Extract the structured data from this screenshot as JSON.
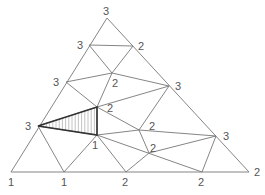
{
  "diagram": {
    "type": "triangulated simplex with vertex labels (Sperner labeling)",
    "nodes": [
      {
        "id": "n0",
        "x": 107,
        "y": 18,
        "label": "3",
        "lx": 103,
        "ly": 15
      },
      {
        "id": "n1",
        "x": 89,
        "y": 45,
        "label": "3",
        "lx": 77,
        "ly": 49
      },
      {
        "id": "n2",
        "x": 133,
        "y": 46,
        "label": "2",
        "lx": 138,
        "ly": 50
      },
      {
        "id": "n3",
        "x": 112,
        "y": 73,
        "label": "2",
        "lx": 112,
        "ly": 87
      },
      {
        "id": "n4",
        "x": 66,
        "y": 82,
        "label": "3",
        "lx": 53,
        "ly": 86
      },
      {
        "id": "n5",
        "x": 169,
        "y": 86,
        "label": "3",
        "lx": 175,
        "ly": 90
      },
      {
        "id": "n6",
        "x": 97,
        "y": 107,
        "label": "2",
        "lx": 107,
        "ly": 112
      },
      {
        "id": "n7",
        "x": 38,
        "y": 126,
        "label": "3",
        "lx": 25,
        "ly": 130
      },
      {
        "id": "n8",
        "x": 97,
        "y": 135,
        "label": "1",
        "lx": 92,
        "ly": 149
      },
      {
        "id": "n9",
        "x": 139,
        "y": 130,
        "label": "2",
        "lx": 149,
        "ly": 130
      },
      {
        "id": "n10",
        "x": 149,
        "y": 153,
        "label": "2",
        "lx": 150,
        "ly": 152
      },
      {
        "id": "n11",
        "x": 216,
        "y": 136,
        "label": "3",
        "lx": 223,
        "ly": 140
      },
      {
        "id": "n12",
        "x": 11,
        "y": 172,
        "label": "1",
        "lx": 8,
        "ly": 186
      },
      {
        "id": "n13",
        "x": 64,
        "y": 172,
        "label": "1",
        "lx": 61,
        "ly": 186
      },
      {
        "id": "n14",
        "x": 126,
        "y": 172,
        "label": "2",
        "lx": 122,
        "ly": 186
      },
      {
        "id": "n15",
        "x": 202,
        "y": 172,
        "label": "2",
        "lx": 198,
        "ly": 186
      },
      {
        "id": "n16",
        "x": 249,
        "y": 172,
        "label": "2",
        "lx": 254,
        "ly": 176
      }
    ],
    "edges": [
      [
        "n0",
        "n12"
      ],
      [
        "n0",
        "n16"
      ],
      [
        "n12",
        "n16"
      ],
      [
        "n1",
        "n2"
      ],
      [
        "n1",
        "n3"
      ],
      [
        "n2",
        "n3"
      ],
      [
        "n4",
        "n3"
      ],
      [
        "n3",
        "n5"
      ],
      [
        "n4",
        "n6"
      ],
      [
        "n3",
        "n6"
      ],
      [
        "n6",
        "n5"
      ],
      [
        "n6",
        "n9"
      ],
      [
        "n5",
        "n9"
      ],
      [
        "n7",
        "n6"
      ],
      [
        "n7",
        "n8"
      ],
      [
        "n6",
        "n8"
      ],
      [
        "n7",
        "n13"
      ],
      [
        "n13",
        "n8"
      ],
      [
        "n8",
        "n14"
      ],
      [
        "n8",
        "n9"
      ],
      [
        "n9",
        "n11"
      ],
      [
        "n9",
        "n10"
      ],
      [
        "n8",
        "n15"
      ],
      [
        "n10",
        "n14"
      ],
      [
        "n10",
        "n11"
      ],
      [
        "n11",
        "n15"
      ]
    ],
    "highlighted_triangle": [
      "n7",
      "n6",
      "n8"
    ],
    "highlight_labels": [
      "3",
      "2",
      "1"
    ]
  }
}
